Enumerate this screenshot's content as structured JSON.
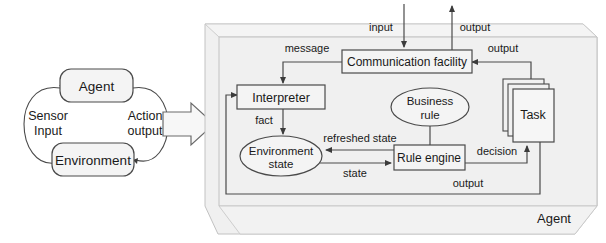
{
  "figure": {
    "type": "diagram",
    "panels": [
      "agent-environment-loop",
      "agent-internal-architecture"
    ]
  },
  "left_panel": {
    "name": "agent-environment-loop",
    "nodes": [
      {
        "id": "agent",
        "label": "Agent",
        "shape": "rounded-rect"
      },
      {
        "id": "environment",
        "label": "Environment",
        "shape": "rounded-rect"
      }
    ],
    "edges": [
      {
        "id": "sensor-input",
        "label_line1": "Sensor",
        "label_line2": "Input",
        "from": "environment",
        "to": "agent"
      },
      {
        "id": "action-output",
        "label_line1": "Action",
        "label_line2": "output",
        "from": "agent",
        "to": "environment"
      }
    ]
  },
  "transition": {
    "name": "right-arrow",
    "icon": "arrow-right-icon"
  },
  "right_panel": {
    "name": "agent-internal-architecture",
    "container_label": "Agent",
    "nodes": [
      {
        "id": "communication-facility",
        "label": "Communication facility",
        "shape": "rect"
      },
      {
        "id": "interpreter",
        "label": "Interpreter",
        "shape": "rect"
      },
      {
        "id": "environment-state",
        "label_line1": "Environment",
        "label_line2": "state",
        "shape": "ellipse"
      },
      {
        "id": "business-rule",
        "label_line1": "Business",
        "label_line2": "rule",
        "shape": "ellipse"
      },
      {
        "id": "rule-engine",
        "label": "Rule engine",
        "shape": "rect"
      },
      {
        "id": "task",
        "label": "Task",
        "shape": "stacked-rect"
      }
    ],
    "edges": [
      {
        "id": "input",
        "label": "input",
        "from": "external",
        "to": "communication-facility"
      },
      {
        "id": "output-top",
        "label": "output",
        "from": "communication-facility",
        "to": "external"
      },
      {
        "id": "message",
        "label": "message",
        "from": "communication-facility",
        "to": "interpreter"
      },
      {
        "id": "output-task",
        "label": "output",
        "from": "task",
        "to": "communication-facility"
      },
      {
        "id": "fact",
        "label": "fact",
        "from": "interpreter",
        "to": "environment-state"
      },
      {
        "id": "refreshed-state",
        "label": "refreshed state",
        "from": "rule-engine",
        "to": "environment-state"
      },
      {
        "id": "state",
        "label": "state",
        "from": "environment-state",
        "to": "rule-engine"
      },
      {
        "id": "decision",
        "label": "decision",
        "from": "rule-engine",
        "to": "task"
      },
      {
        "id": "output-loop",
        "label": "output",
        "from": "task",
        "to": "interpreter"
      },
      {
        "id": "business-rule-link",
        "label": "",
        "from": "business-rule",
        "to": "rule-engine"
      }
    ]
  },
  "style": {
    "line_color": "#4a4a4a",
    "node_fill": "#f2f2f2",
    "container_fill": "#f0f0f0",
    "text_color": "#1a1a1a"
  }
}
